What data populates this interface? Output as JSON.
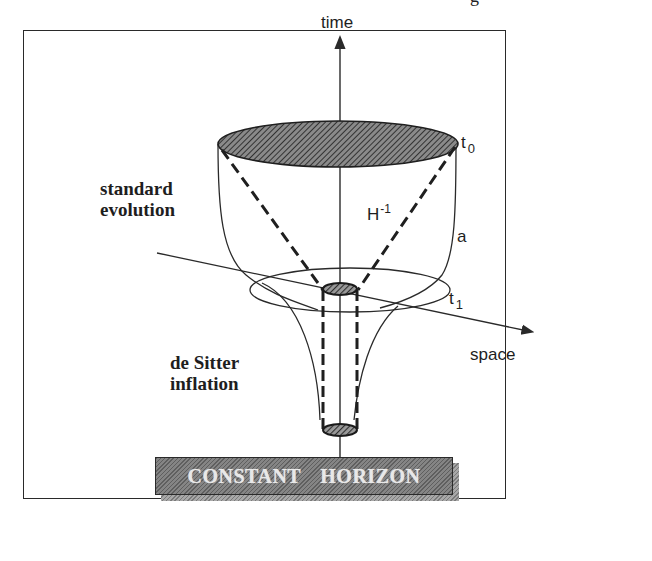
{
  "page_heading_fragment": "g",
  "diagram": {
    "axes": {
      "vertical_label": "time",
      "horizontal_label": "space"
    },
    "labels": {
      "t0": {
        "base": "t",
        "sub": "0"
      },
      "t1": {
        "base": "t",
        "sub": "1"
      },
      "hubble_radius": {
        "base": "H",
        "sup": "-1"
      },
      "scale_factor": "a",
      "standard_evolution": [
        "standard",
        "evolution"
      ],
      "de_sitter_inflation": [
        "de Sitter",
        "inflation"
      ]
    },
    "banner": {
      "text": "CONSTANT HORIZON"
    },
    "colors": {
      "line": "#2a2a2a",
      "hatch_dark": "#3a3a3a",
      "banner_fill": "#6e6e6e",
      "banner_text": "#e8e8e8"
    }
  }
}
